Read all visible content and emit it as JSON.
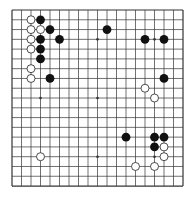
{
  "board": {
    "size": 19,
    "origin_x": 12,
    "origin_y": 10,
    "spacing_x": 9.5,
    "spacing_y": 9.78,
    "line_color": "#333333",
    "background": "#ffffff",
    "star_points": [
      [
        3,
        3
      ],
      [
        9,
        3
      ],
      [
        15,
        3
      ],
      [
        3,
        9
      ],
      [
        9,
        9
      ],
      [
        15,
        9
      ],
      [
        3,
        15
      ],
      [
        9,
        15
      ],
      [
        15,
        15
      ]
    ],
    "stone_radius": 4.4
  },
  "colors": {
    "black": "#111111",
    "white_fill": "#ffffff",
    "white_stroke": "#222222"
  },
  "stones": {
    "black": [
      [
        3,
        1
      ],
      [
        4,
        2
      ],
      [
        3,
        3
      ],
      [
        5,
        3
      ],
      [
        3,
        4
      ],
      [
        3,
        5
      ],
      [
        4,
        7
      ],
      [
        10,
        2
      ],
      [
        14,
        3
      ],
      [
        16,
        3
      ],
      [
        16,
        7
      ],
      [
        12,
        13
      ],
      [
        15,
        13
      ],
      [
        16,
        13
      ],
      [
        15,
        14
      ]
    ],
    "white": [
      [
        2,
        1
      ],
      [
        2,
        2
      ],
      [
        3,
        2
      ],
      [
        2,
        3
      ],
      [
        2,
        4
      ],
      [
        2,
        6
      ],
      [
        2,
        7
      ],
      [
        14,
        8
      ],
      [
        15,
        9
      ],
      [
        16,
        14
      ],
      [
        16,
        15
      ],
      [
        13,
        16
      ],
      [
        15,
        16
      ],
      [
        3,
        15
      ]
    ]
  }
}
